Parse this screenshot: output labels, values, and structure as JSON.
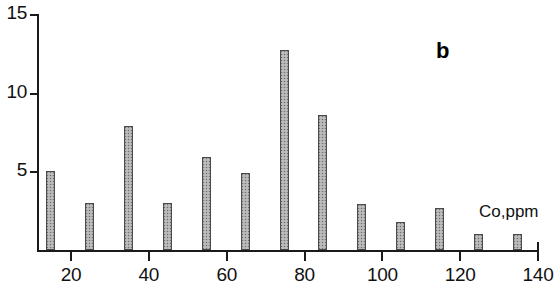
{
  "chart_data": {
    "type": "bar",
    "title": "",
    "subtitle": "",
    "panel_label": "b",
    "xlabel": "Co,ppm",
    "ylabel": "",
    "categories": [
      15,
      25,
      35,
      45,
      55,
      65,
      75,
      85,
      95,
      105,
      115,
      125,
      135
    ],
    "values": [
      5.0,
      3.0,
      7.9,
      3.0,
      5.9,
      4.9,
      12.7,
      8.6,
      2.9,
      1.8,
      2.7,
      1.0,
      1.0
    ],
    "bin_width": 10,
    "xlim": [
      10,
      140
    ],
    "ylim": [
      0,
      15
    ],
    "xticks": [
      20,
      40,
      60,
      80,
      100,
      120,
      140
    ],
    "xtick_labels": [
      "20",
      "40",
      "60",
      "80",
      "100",
      "120",
      "140"
    ],
    "yticks": [
      5,
      10,
      15
    ],
    "ytick_labels": [
      "5",
      "10",
      "15"
    ],
    "grid": false,
    "legend": false,
    "legend_position": "none",
    "bar_fill_color": "#c9c9c9",
    "bar_edge_color": "#4a4a4a",
    "axis_color": "#1a1a1a",
    "background_color": "#ffffff"
  }
}
